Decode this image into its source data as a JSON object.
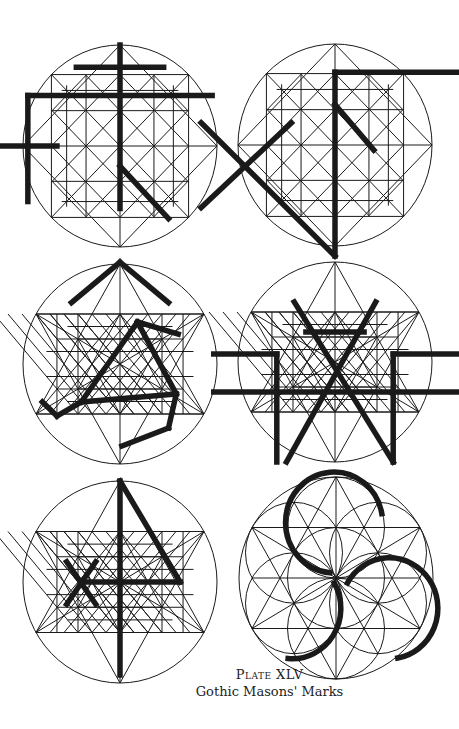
{
  "caption": {
    "plate_label": "Plate XLV",
    "title": "Gothic Masons' Marks"
  },
  "style": {
    "ink": "#1a1a1a",
    "background": "#ffffff",
    "thin_width": 1,
    "thick_width": 5.5
  },
  "figures": [
    {
      "id": "mark-1-cross",
      "cx": 120,
      "cy": 146,
      "rx": 97,
      "ry": 101,
      "grid": "square",
      "thick": [
        [
          [
            0,
            -1
          ],
          [
            0,
            0.62
          ]
        ],
        [
          [
            -0.45,
            -0.78
          ],
          [
            0.45,
            -0.78
          ]
        ],
        [
          [
            -0.95,
            -0.5
          ],
          [
            0.95,
            -0.5
          ]
        ],
        [
          [
            -0.95,
            -0.5
          ],
          [
            -0.95,
            0.55
          ]
        ],
        [
          [
            -1.38,
            0
          ],
          [
            -0.65,
            0
          ]
        ],
        [
          [
            0,
            0.2
          ],
          [
            0.5,
            0.72
          ]
        ],
        [
          [
            0,
            1.15
          ],
          [
            -0.5,
            1.55
          ]
        ],
        [
          [
            0,
            1.15
          ],
          [
            0.5,
            1.55
          ]
        ]
      ]
    },
    {
      "id": "mark-2-x-flag",
      "cx": 335,
      "cy": 145,
      "rx": 97,
      "ry": 101,
      "grid": "square",
      "thick": [
        [
          [
            0,
            -0.72
          ],
          [
            0,
            1.1
          ]
        ],
        [
          [
            0,
            -0.72
          ],
          [
            1.32,
            -0.72
          ]
        ],
        [
          [
            0,
            -0.4
          ],
          [
            0.4,
            0.05
          ]
        ],
        [
          [
            -1.38,
            -0.22
          ],
          [
            0,
            1.1
          ]
        ],
        [
          [
            -1.38,
            0.62
          ],
          [
            -0.45,
            -0.22
          ]
        ]
      ]
    },
    {
      "id": "mark-3-triangle-hook",
      "cx": 120,
      "cy": 364,
      "rx": 97,
      "ry": 100,
      "grid": "hexagram",
      "thick": [
        [
          [
            0.18,
            -0.42
          ],
          [
            0.6,
            -0.3
          ]
        ],
        [
          [
            0.18,
            -0.42
          ],
          [
            -0.4,
            0.38
          ]
        ],
        [
          [
            0.18,
            -0.42
          ],
          [
            0.58,
            0.3
          ]
        ],
        [
          [
            -0.4,
            0.38
          ],
          [
            0.58,
            0.3
          ]
        ],
        [
          [
            -0.4,
            0.38
          ],
          [
            -0.65,
            0.52
          ]
        ],
        [
          [
            -0.65,
            0.52
          ],
          [
            -0.8,
            0.38
          ]
        ],
        [
          [
            0.58,
            0.3
          ],
          [
            0.5,
            0.64
          ]
        ],
        [
          [
            0.5,
            0.64
          ],
          [
            0.02,
            0.82
          ]
        ]
      ]
    },
    {
      "id": "mark-4-woven-w",
      "cx": 335,
      "cy": 362,
      "rx": 97,
      "ry": 100,
      "grid": "hexagram",
      "thick": [
        [
          [
            -0.42,
            -0.6
          ],
          [
            0.6,
            1.0
          ]
        ],
        [
          [
            0.42,
            -0.6
          ],
          [
            -0.5,
            1.0
          ]
        ],
        [
          [
            -1.25,
            0.3
          ],
          [
            1.25,
            0.3
          ]
        ],
        [
          [
            -1.25,
            -0.08
          ],
          [
            -0.6,
            -0.08
          ]
        ],
        [
          [
            0.6,
            -0.08
          ],
          [
            1.25,
            -0.08
          ]
        ],
        [
          [
            -0.6,
            -0.08
          ],
          [
            -0.6,
            1.0
          ]
        ],
        [
          [
            0.6,
            -0.08
          ],
          [
            0.6,
            1.0
          ]
        ],
        [
          [
            -0.3,
            -0.3
          ],
          [
            0.3,
            -0.3
          ]
        ]
      ]
    },
    {
      "id": "mark-5-four-arrow",
      "cx": 120,
      "cy": 582,
      "rx": 97,
      "ry": 101,
      "grid": "hexagram",
      "thick": [
        [
          [
            0,
            -1
          ],
          [
            0,
            0.92
          ]
        ],
        [
          [
            0,
            -1
          ],
          [
            0.62,
            0.0
          ]
        ],
        [
          [
            -0.38,
            0.0
          ],
          [
            0.62,
            0.0
          ]
        ],
        [
          [
            -0.55,
            -0.2
          ],
          [
            -0.25,
            0.22
          ]
        ],
        [
          [
            -0.25,
            -0.2
          ],
          [
            -0.55,
            0.22
          ]
        ]
      ]
    },
    {
      "id": "mark-6-triple-arc",
      "cx": 336,
      "cy": 578,
      "rx": 97,
      "ry": 101,
      "grid": "flower",
      "arcs": [
        {
          "c": [
            -0.02,
            -0.55
          ],
          "r": 0.5,
          "from": 95,
          "to": 350
        },
        {
          "c": [
            0.55,
            0.3
          ],
          "r": 0.5,
          "from": 210,
          "to": 440
        },
        {
          "c": [
            -0.45,
            0.3
          ],
          "r": 0.5,
          "from": 330,
          "to": 455
        }
      ]
    }
  ]
}
